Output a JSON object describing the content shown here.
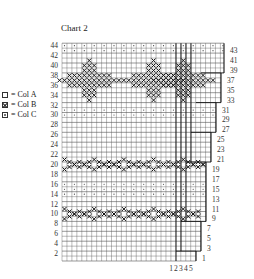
{
  "title": "Chart 2",
  "legend": [
    {
      "symbol": "empty-square",
      "label": "= Col A"
    },
    {
      "symbol": "cross-square",
      "label": "= Col B"
    },
    {
      "symbol": "dot-square",
      "label": "= Col C"
    }
  ],
  "chart_data": {
    "type": "table",
    "title": "Chart 2",
    "rows": 44,
    "left_row_labels": [
      2,
      4,
      6,
      8,
      10,
      12,
      14,
      16,
      18,
      20,
      22,
      24,
      26,
      28,
      30,
      32,
      34,
      36,
      38,
      40,
      42,
      44
    ],
    "right_row_labels": [
      1,
      3,
      5,
      7,
      9,
      11,
      13,
      15,
      17,
      19,
      21,
      23,
      25,
      27,
      29,
      31,
      33,
      35,
      37,
      39,
      41,
      43
    ],
    "bottom_column_labels": [
      "1",
      "2",
      "3",
      "4",
      "5"
    ],
    "legend": [
      "Col A",
      "Col B",
      "Col C"
    ],
    "bands": [
      {
        "rows": [
          44,
          44
        ],
        "colour": "Col C",
        "pattern": "dotted row"
      },
      {
        "rows": [
          30,
          31
        ],
        "colour": "Col C",
        "pattern": "dotted rows"
      },
      {
        "rows": [
          33,
          41
        ],
        "colour": "Col B",
        "pattern": "large cross / star motifs"
      },
      {
        "rows": [
          19,
          22
        ],
        "colour": "Col B",
        "pattern": "zigzag X band"
      },
      {
        "rows": [
          14,
          16
        ],
        "colour": "Col C",
        "pattern": "dotted rows"
      },
      {
        "rows": [
          9,
          12
        ],
        "colour": "Col B",
        "pattern": "zigzag X band"
      }
    ]
  },
  "colors": {
    "ink": "#222222",
    "grid": "#555555",
    "background": "#ffffff"
  }
}
